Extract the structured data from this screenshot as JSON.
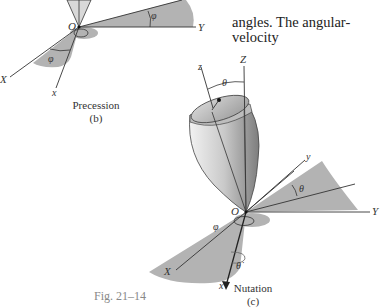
{
  "body_text": {
    "lines": [
      "y",
      "angles. The angular-velocity"
    ]
  },
  "precession": {
    "caption": "Precession",
    "sub": "(b)",
    "labels": {
      "O": "O",
      "Y": "Y",
      "X": "X",
      "x": "x",
      "phi_top": "φ",
      "phi_bottom": "φ"
    }
  },
  "nutation": {
    "caption": "Nutation",
    "sub": "(c)",
    "labels": {
      "Z": "Z",
      "z": "z",
      "theta_top": "θ",
      "O": "O",
      "y": "y",
      "Y": "Y",
      "theta_right": "θ",
      "phi": "φ",
      "X": "X",
      "x": "x",
      "theta_dot": "θ̇"
    }
  },
  "figure_label": "Fig. 21–14",
  "colors": {
    "shade": "#b3b3b3",
    "line": "#2a2a2a",
    "body_light": "#e6e6e6",
    "body_dark": "#8c8c8c"
  }
}
